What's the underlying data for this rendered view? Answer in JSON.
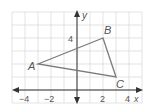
{
  "figure": {
    "type": "coordinate-plane-triangle",
    "axes": {
      "x_label": "x",
      "y_label": "y",
      "x_ticks": [
        {
          "value": -4,
          "label": "−4"
        },
        {
          "value": -2,
          "label": "−2"
        },
        {
          "value": 2,
          "label": "2"
        },
        {
          "value": 4,
          "label": "4"
        }
      ],
      "y_ticks": [
        {
          "value": 4,
          "label": "4"
        }
      ],
      "x_range": [
        -5,
        5
      ],
      "y_range": [
        -1,
        6
      ],
      "grid": true
    },
    "triangle": {
      "vertices": [
        {
          "name": "A",
          "x": -3,
          "y": 2
        },
        {
          "name": "B",
          "x": 2,
          "y": 4
        },
        {
          "name": "C",
          "x": 3,
          "y": 1
        }
      ],
      "stroke_color": "#7a7a7a"
    },
    "colors": {
      "grid": "#dcdcdc",
      "axis": "#333333",
      "text": "#555555"
    }
  }
}
